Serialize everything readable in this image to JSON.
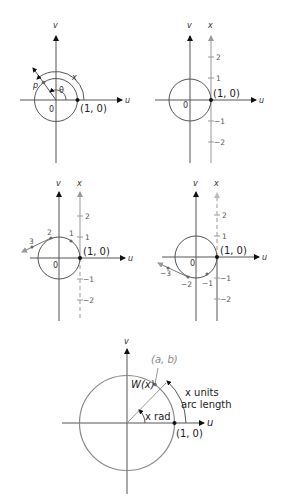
{
  "panels": {
    "p1": {
      "v_label": "v",
      "u_label": "u",
      "origin_label": "0",
      "point_label": "(1, 0)",
      "p_label": "p",
      "theta_label": "θ",
      "arc_label": "x"
    },
    "p2": {
      "v_label": "v",
      "x_label": "x",
      "u_label": "u",
      "origin_label": "0",
      "point_label": "(1, 0)",
      "ticks": [
        "2",
        "1",
        "−1",
        "−2"
      ]
    },
    "p3": {
      "v_label": "v",
      "x_label": "x",
      "u_label": "u",
      "origin_label": "0",
      "point_label": "(1, 0)",
      "ticks": [
        "2",
        "1",
        "−1",
        "−2"
      ],
      "wrap_labels": [
        "1",
        "2",
        "3"
      ]
    },
    "p4": {
      "v_label": "v",
      "x_label": "x",
      "u_label": "u",
      "origin_label": "0",
      "point_label": "(1, 0)",
      "ticks": [
        "2",
        "1",
        "−1",
        "−2"
      ],
      "wrap_labels": [
        "−1",
        "−2",
        "−3"
      ]
    },
    "p5": {
      "v_label": "v",
      "u_label": "u",
      "point_label": "(1, 0)",
      "ab_label": "(a, b)",
      "w_label": "W(x)",
      "angle_label": "x rad",
      "arc_label_1": "x units",
      "arc_label_2": "arc length"
    }
  }
}
